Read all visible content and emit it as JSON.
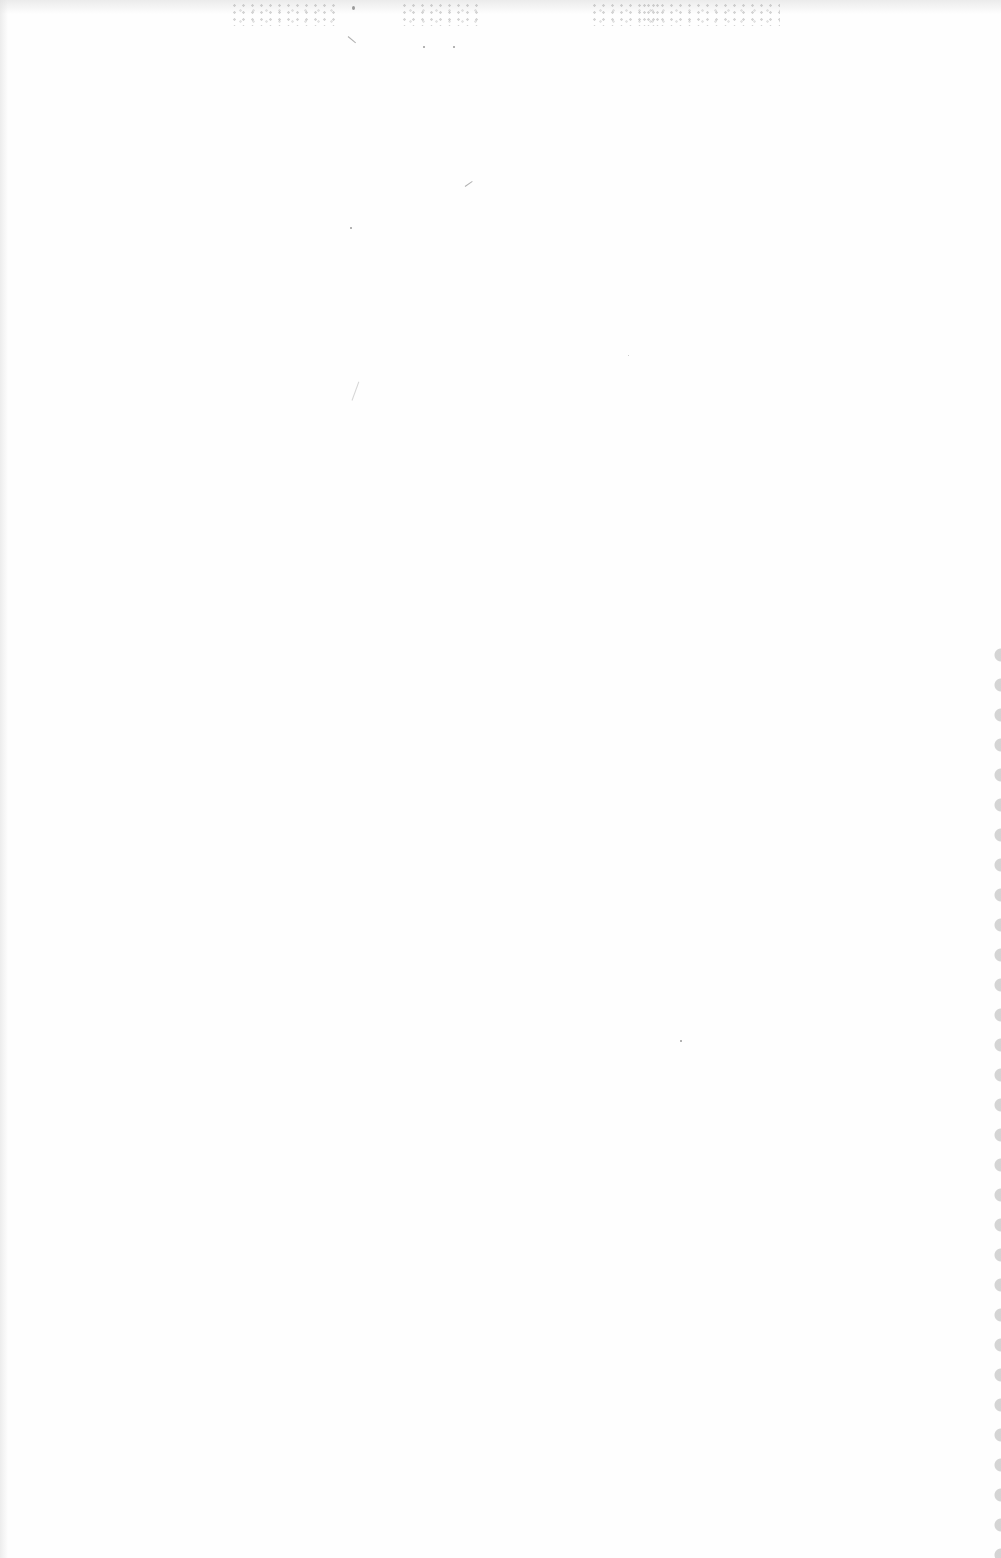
{
  "page": {
    "kind": "blank-scanned-page",
    "background_color": "#fefefe",
    "edge_color": "#cdcdcd",
    "text": ""
  }
}
